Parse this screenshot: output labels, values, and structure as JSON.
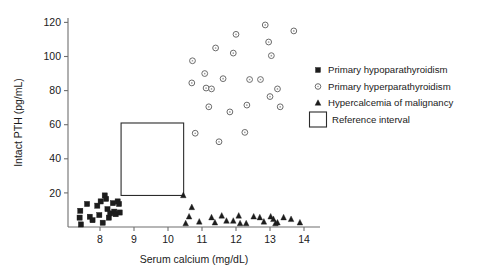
{
  "chart_data": {
    "type": "scatter",
    "title": "",
    "xlabel": "Serum calcium (mg/dL)",
    "ylabel": "Intact PTH (pg/mL)",
    "xlim": [
      7.2,
      14.45
    ],
    "ylim": [
      0,
      126
    ],
    "xticks": [
      8,
      9,
      10,
      11,
      12,
      13,
      14
    ],
    "xticklabels": [
      "8",
      "9",
      "10",
      "11",
      "12",
      "13",
      "14"
    ],
    "yticks": [
      20,
      40,
      60,
      80,
      100,
      120
    ],
    "yticklabels": [
      "20",
      "40",
      "60",
      "80",
      "100",
      "120"
    ],
    "grid": false,
    "legend_position": "right",
    "series": [
      {
        "name": "Primary hypoparathyroidism",
        "marker": "filled-square",
        "color": "#1c1c1c",
        "points": [
          [
            7.42,
            9.5
          ],
          [
            7.4,
            5.5
          ],
          [
            7.44,
            1.5
          ],
          [
            7.62,
            13.5
          ],
          [
            7.7,
            6.0
          ],
          [
            7.78,
            4.0
          ],
          [
            7.92,
            12.5
          ],
          [
            7.98,
            7.0
          ],
          [
            8.02,
            15.0
          ],
          [
            8.08,
            2.5
          ],
          [
            8.14,
            18.5
          ],
          [
            8.18,
            16.5
          ],
          [
            8.22,
            10.5
          ],
          [
            8.26,
            5.5
          ],
          [
            8.3,
            8.0
          ],
          [
            8.38,
            14.0
          ],
          [
            8.42,
            9.0
          ],
          [
            8.46,
            7.5
          ],
          [
            8.52,
            15.0
          ],
          [
            8.56,
            13.5
          ],
          [
            8.58,
            8.5
          ]
        ]
      },
      {
        "name": "Primary hyperparathyroidism",
        "marker": "open-circle",
        "color": "#6b6b6b",
        "points": [
          [
            10.72,
            97.5
          ],
          [
            10.7,
            84.5
          ],
          [
            10.8,
            55.0
          ],
          [
            11.08,
            90.0
          ],
          [
            11.12,
            81.5
          ],
          [
            11.2,
            70.5
          ],
          [
            11.28,
            81.0
          ],
          [
            11.4,
            105.0
          ],
          [
            11.5,
            50.0
          ],
          [
            11.62,
            87.0
          ],
          [
            11.82,
            67.5
          ],
          [
            11.92,
            102.0
          ],
          [
            12.0,
            113.0
          ],
          [
            12.26,
            55.5
          ],
          [
            12.32,
            71.5
          ],
          [
            12.4,
            86.5
          ],
          [
            12.72,
            86.5
          ],
          [
            12.86,
            118.5
          ],
          [
            12.96,
            108.5
          ],
          [
            13.0,
            76.5
          ],
          [
            13.04,
            100.5
          ],
          [
            13.22,
            81.0
          ],
          [
            13.3,
            70.5
          ],
          [
            13.7,
            115.0
          ]
        ]
      },
      {
        "name": "Hypercalcemia of malignancy",
        "marker": "filled-triangle",
        "color": "#1c1c1c",
        "points": [
          [
            10.45,
            18.5
          ],
          [
            10.52,
            2.0
          ],
          [
            10.62,
            6.0
          ],
          [
            10.7,
            11.5
          ],
          [
            10.92,
            3.0
          ],
          [
            11.28,
            5.5
          ],
          [
            11.38,
            2.5
          ],
          [
            11.58,
            6.5
          ],
          [
            11.72,
            3.5
          ],
          [
            11.92,
            3.5
          ],
          [
            12.08,
            6.5
          ],
          [
            12.12,
            2.0
          ],
          [
            12.3,
            2.0
          ],
          [
            12.52,
            6.0
          ],
          [
            12.7,
            5.5
          ],
          [
            12.82,
            3.0
          ],
          [
            13.02,
            6.0
          ],
          [
            13.1,
            4.5
          ],
          [
            13.16,
            2.0
          ],
          [
            13.22,
            2.5
          ],
          [
            13.4,
            5.5
          ],
          [
            13.62,
            4.5
          ],
          [
            13.88,
            2.5
          ]
        ]
      }
    ],
    "annotations": [
      {
        "name": "Reference interval",
        "shape": "rectangle",
        "x_range": [
          8.62,
          10.46
        ],
        "y_range": [
          18.5,
          61.0
        ]
      }
    ]
  },
  "legend": {
    "items": [
      {
        "label": "Primary hypoparathyroidism",
        "marker": "filled-square"
      },
      {
        "label": "Primary hyperparathyroidism",
        "marker": "open-circle"
      },
      {
        "label": "Hypercalcemia of malignancy",
        "marker": "filled-triangle"
      },
      {
        "label": "Reference interval",
        "marker": "open-rectangle"
      }
    ]
  }
}
